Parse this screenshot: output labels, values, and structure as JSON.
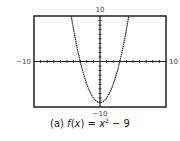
{
  "chart_data": {
    "type": "line",
    "title": "",
    "function": "x^2 - 9",
    "xlim": [
      -10,
      10
    ],
    "ylim": [
      -10,
      10
    ],
    "xscale_ticks": 1,
    "yscale_ticks": 1,
    "grid": false,
    "tick_labels": {
      "xmin": "−10",
      "xmax": "10",
      "ymin": "−10",
      "ymax": "10"
    },
    "series": [
      {
        "name": "f(x) = x² − 9",
        "x": [
          -4.36,
          -4,
          -3,
          -2,
          -1,
          0,
          1,
          2,
          3,
          4,
          4.36
        ],
        "y": [
          10,
          7,
          0,
          -5,
          -8,
          -9,
          -8,
          -5,
          0,
          7,
          10
        ]
      }
    ],
    "caption": {
      "prefix": "(a) ",
      "fname": "f",
      "arg_open": "(",
      "var": "x",
      "arg_close": ")",
      "equals": " = ",
      "base": "x",
      "exp": "2",
      "rest": " − 9"
    }
  }
}
